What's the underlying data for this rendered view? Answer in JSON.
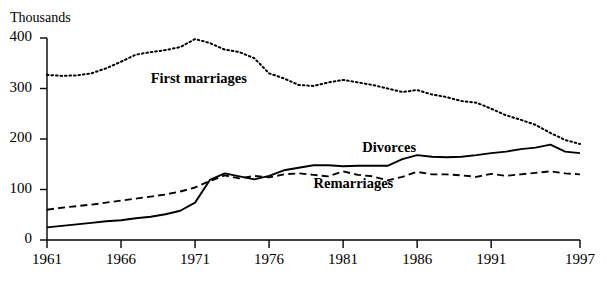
{
  "chart_data": {
    "type": "line",
    "title": "",
    "subtitle": "",
    "xlabel": "",
    "ylabel": "Thousands",
    "unit_label": "Thousands",
    "xlim": [
      1961,
      1997
    ],
    "ylim": [
      0,
      400
    ],
    "grid": false,
    "legend_position": "inline-annotations",
    "y_ticks": [
      "0",
      "100",
      "200",
      "300",
      "400"
    ],
    "y_tick_values": [
      0,
      100,
      200,
      300,
      400
    ],
    "x_ticks": [
      "1961",
      "1966",
      "1971",
      "1976",
      "1981",
      "1986",
      "1991",
      "1997"
    ],
    "x_tick_values": [
      1961,
      1966,
      1971,
      1976,
      1981,
      1986,
      1991,
      1997
    ],
    "x": [
      1961,
      1962,
      1963,
      1964,
      1965,
      1966,
      1967,
      1968,
      1969,
      1970,
      1971,
      1972,
      1973,
      1974,
      1975,
      1976,
      1977,
      1978,
      1979,
      1980,
      1981,
      1982,
      1983,
      1984,
      1985,
      1986,
      1987,
      1988,
      1989,
      1990,
      1991,
      1992,
      1993,
      1994,
      1995,
      1996,
      1997
    ],
    "series": [
      {
        "name": "First marriages",
        "style": "dotted",
        "color": "#000000",
        "values": [
          327,
          325,
          326,
          330,
          340,
          353,
          367,
          372,
          376,
          382,
          398,
          390,
          377,
          372,
          360,
          330,
          320,
          307,
          305,
          312,
          317,
          312,
          307,
          300,
          293,
          297,
          288,
          283,
          275,
          272,
          260,
          247,
          238,
          228,
          212,
          198,
          190
        ]
      },
      {
        "name": "Divorces",
        "style": "solid",
        "color": "#000000",
        "values": [
          25,
          28,
          31,
          34,
          37,
          39,
          43,
          46,
          51,
          58,
          74,
          119,
          132,
          126,
          120,
          127,
          138,
          143,
          148,
          148,
          146,
          147,
          147,
          147,
          160,
          168,
          165,
          164,
          165,
          168,
          172,
          175,
          180,
          183,
          189,
          175,
          172
        ]
      },
      {
        "name": "Remarriages",
        "style": "dashed",
        "color": "#000000",
        "values": [
          60,
          64,
          67,
          70,
          74,
          78,
          82,
          86,
          90,
          96,
          104,
          117,
          128,
          122,
          127,
          124,
          130,
          132,
          129,
          126,
          136,
          129,
          126,
          118,
          125,
          135,
          130,
          130,
          128,
          125,
          131,
          127,
          130,
          133,
          136,
          132,
          130
        ]
      }
    ],
    "annotations": [
      {
        "text": "First marriages",
        "x": 1968.0,
        "y": 318,
        "name": "first-marriages-label"
      },
      {
        "text": "Divorces",
        "x": 1982.3,
        "y": 182,
        "name": "divorces-label"
      },
      {
        "text": "Remarriages",
        "x": 1979.0,
        "y": 110,
        "name": "remarriages-label"
      }
    ]
  }
}
